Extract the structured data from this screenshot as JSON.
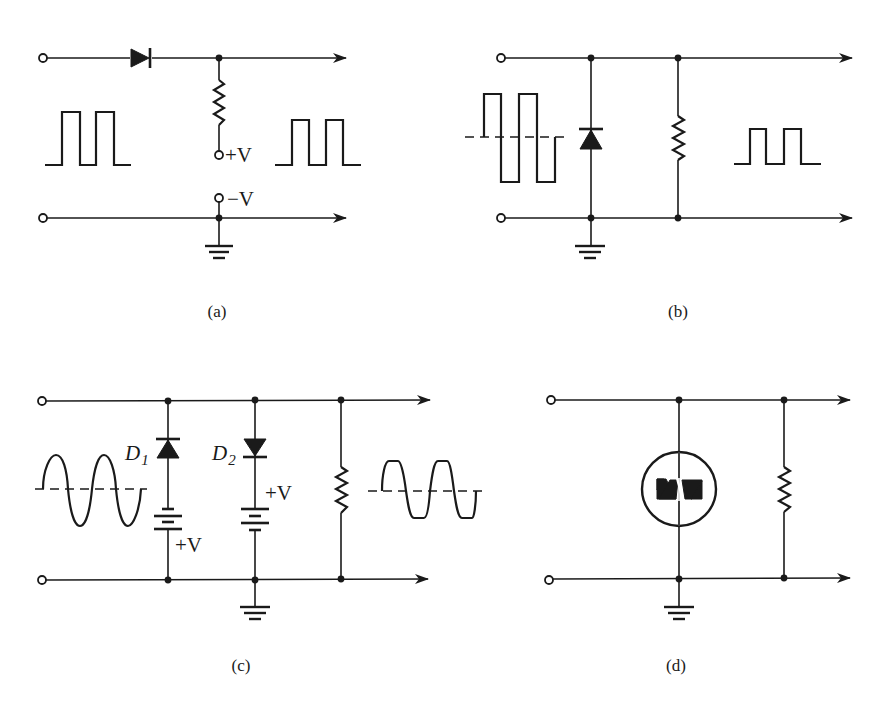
{
  "figure": {
    "panels": [
      {
        "id": "a",
        "caption": "(a)",
        "description": "Series diode clipper with resistor to bias supply",
        "components": [
          "input-terminals",
          "series-diode",
          "resistor",
          "bias-terminals",
          "ground"
        ],
        "labels": {
          "plus_v": "+V",
          "minus_v": "−V"
        },
        "input_waveform": "square-pulse",
        "output_waveform": "square-pulse"
      },
      {
        "id": "b",
        "caption": "(b)",
        "description": "Shunt diode clipper removing negative half",
        "components": [
          "input-terminals",
          "shunt-diode",
          "load-resistor",
          "ground"
        ],
        "input_waveform": "bipolar-square",
        "output_waveform": "unipolar-square"
      },
      {
        "id": "c",
        "caption": "(c)",
        "description": "Two-level biased diode clipper",
        "components": [
          "input-terminals",
          "diode-d1",
          "battery-1",
          "diode-d2",
          "battery-2",
          "load-resistor",
          "ground"
        ],
        "labels": {
          "d1": "D",
          "d1_sub": "1",
          "d2": "D",
          "d2_sub": "2",
          "v1": "+V",
          "v2": "+V"
        },
        "input_waveform": "sine",
        "output_waveform": "clipped-sine"
      },
      {
        "id": "d",
        "caption": "(d)",
        "description": "Bidirectional transient voltage suppressor clipper",
        "components": [
          "input-terminals",
          "bidirectional-tvs",
          "load-resistor",
          "ground"
        ]
      }
    ]
  }
}
